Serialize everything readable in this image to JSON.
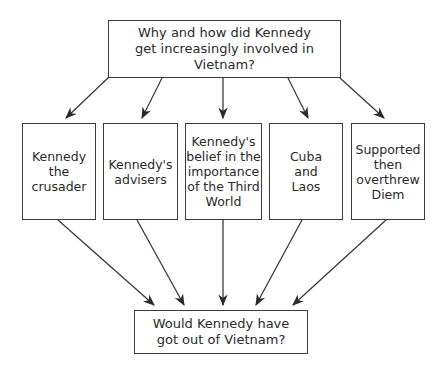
{
  "diagram": {
    "top_question": "Why and how did Kennedy\nget increasingly involved in\nVietnam?",
    "factors": [
      {
        "label": "Kennedy\nthe\ncrusader"
      },
      {
        "label": "Kennedy's\nadvisers"
      },
      {
        "label": "Kennedy's\nbelief in the\nimportance\nof the Third\nWorld"
      },
      {
        "label": "Cuba\nand\nLaos"
      },
      {
        "label": "Supported\nthen\noverthrew\nDiem"
      }
    ],
    "bottom_question": "Would Kennedy have\ngot out of Vietnam?",
    "colors": {
      "line": "#3a3a3a",
      "text": "#2a2a2a",
      "background": "#ffffff"
    }
  }
}
